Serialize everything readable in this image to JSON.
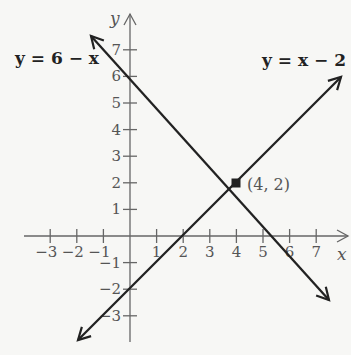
{
  "chart_data": {
    "type": "line",
    "title": "",
    "xlabel": "x",
    "ylabel": "y",
    "xlim": [
      -4,
      8
    ],
    "ylim": [
      -4,
      8
    ],
    "grid": false,
    "x_ticks": [
      -3,
      -2,
      -1,
      1,
      2,
      3,
      4,
      5,
      6,
      7
    ],
    "y_ticks": [
      -3,
      -2,
      -1,
      1,
      2,
      3,
      4,
      5,
      6,
      7
    ],
    "x_tick_labels": [
      "−3",
      "−2",
      "−1",
      "1",
      "2",
      "3",
      "4",
      "5",
      "6",
      "7"
    ],
    "y_tick_labels": [
      "−3",
      "−2",
      "−1",
      "1",
      "2",
      "3",
      "4",
      "5",
      "6",
      "7"
    ],
    "series": [
      {
        "name": "y = 6 − x",
        "label": "y = 6 − x",
        "x": [
          -1.5,
          7.5
        ],
        "y": [
          7.5,
          -1.5
        ]
      },
      {
        "name": "y = x − 2",
        "label": "y = x − 2",
        "x": [
          -2,
          8
        ],
        "y": [
          -4,
          6
        ]
      }
    ],
    "annotations": [
      {
        "text": "(4, 2)",
        "x": 4,
        "y": 2,
        "marker": "filled-square-point"
      }
    ],
    "line_color": "#222222",
    "axis_color": "#666666"
  },
  "labels": {
    "x_axis": "x",
    "y_axis": "y",
    "eq1": "y = 6 − x",
    "eq2": "y = x − 2",
    "intersection": "(4, 2)"
  }
}
